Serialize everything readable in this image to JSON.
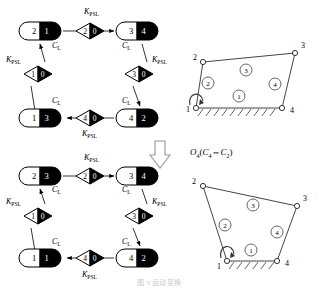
{
  "figure": {
    "caption": "图 3   运动变换",
    "transform_label": {
      "main": "O",
      "main_sub": "4",
      "paren_open": "(",
      "from": "C",
      "from_sub": "4",
      "arrow": "⇔",
      "to": "C",
      "to_sub": "2",
      "paren_close": ")"
    },
    "labels": {
      "kpsl": "K",
      "kpsl_sub": "PSL",
      "cl": "C",
      "cl_sub": "L"
    }
  },
  "graph_top": {
    "name": "kinematic-chain-graph-top",
    "nodes": [
      {
        "id": "n-tl",
        "left": "2",
        "right": "1",
        "x": 40,
        "y": 31
      },
      {
        "id": "n-tr",
        "left": "3",
        "right": "4",
        "x": 137,
        "y": 31
      },
      {
        "id": "n-bl",
        "left": "1",
        "right": "3",
        "x": 40,
        "y": 118
      },
      {
        "id": "n-br",
        "left": "4",
        "right": "2",
        "x": 137,
        "y": 118
      }
    ],
    "joints": [
      {
        "id": "j-top",
        "left": "2",
        "right": "0",
        "x": 90,
        "y": 31
      },
      {
        "id": "j-left",
        "left": "1",
        "right": "0",
        "x": 38,
        "y": 74
      },
      {
        "id": "j-right",
        "left": "3",
        "right": "0",
        "x": 139,
        "y": 74
      },
      {
        "id": "j-bottom",
        "left": "4",
        "right": "0",
        "x": 90,
        "y": 118
      }
    ],
    "kpsl_positions": [
      {
        "x": 84,
        "y": 14
      },
      {
        "x": 6,
        "y": 62
      },
      {
        "x": 152,
        "y": 62
      },
      {
        "x": 82,
        "y": 136
      }
    ],
    "cl_positions": [
      {
        "x": 52,
        "y": 48
      },
      {
        "x": 122,
        "y": 48
      },
      {
        "x": 52,
        "y": 103
      },
      {
        "x": 122,
        "y": 103
      }
    ]
  },
  "graph_bottom": {
    "name": "kinematic-chain-graph-bottom",
    "nodes": [
      {
        "id": "n2-tl",
        "left": "2",
        "right": "3",
        "x": 40,
        "y": 176
      },
      {
        "id": "n2-tr",
        "left": "3",
        "right": "4",
        "x": 137,
        "y": 176
      },
      {
        "id": "n2-bl",
        "left": "1",
        "right": "1",
        "x": 40,
        "y": 258
      },
      {
        "id": "n2-br",
        "left": "4",
        "right": "2",
        "x": 137,
        "y": 258
      }
    ],
    "joints": [
      {
        "id": "j2-top",
        "left": "2",
        "right": "0",
        "x": 90,
        "y": 176
      },
      {
        "id": "j2-left",
        "left": "1",
        "right": "0",
        "x": 38,
        "y": 216
      },
      {
        "id": "j2-right",
        "left": "3",
        "right": "0",
        "x": 139,
        "y": 216
      },
      {
        "id": "j2-bottom",
        "left": "4",
        "right": "0",
        "x": 90,
        "y": 258
      }
    ],
    "kpsl_positions": [
      {
        "x": 84,
        "y": 160
      },
      {
        "x": 6,
        "y": 204
      },
      {
        "x": 152,
        "y": 204
      },
      {
        "x": 82,
        "y": 275
      }
    ],
    "cl_positions": [
      {
        "x": 52,
        "y": 192
      },
      {
        "x": 122,
        "y": 192
      },
      {
        "x": 52,
        "y": 244
      },
      {
        "x": 122,
        "y": 244
      }
    ]
  },
  "linkage_top": {
    "name": "four-bar-linkage-top",
    "vertices": [
      {
        "label": "1",
        "x": 196,
        "y": 108,
        "lx": 186,
        "ly": 112
      },
      {
        "label": "2",
        "x": 203,
        "y": 62,
        "lx": 193,
        "ly": 60
      },
      {
        "label": "3",
        "x": 295,
        "y": 53,
        "lx": 301,
        "ly": 48
      },
      {
        "label": "4",
        "x": 282,
        "y": 108,
        "lx": 290,
        "ly": 113
      }
    ],
    "links": [
      {
        "label": "1",
        "x": 239,
        "y": 96
      },
      {
        "label": "2",
        "x": 208,
        "y": 83
      },
      {
        "label": "3",
        "x": 246,
        "y": 70
      },
      {
        "label": "4",
        "x": 275,
        "y": 84
      }
    ]
  },
  "linkage_bottom": {
    "name": "four-bar-linkage-bottom",
    "vertices": [
      {
        "label": "1",
        "x": 227,
        "y": 261,
        "lx": 217,
        "ly": 266
      },
      {
        "label": "2",
        "x": 203,
        "y": 186,
        "lx": 192,
        "ly": 184
      },
      {
        "label": "3",
        "x": 297,
        "y": 206,
        "lx": 303,
        "ly": 201
      },
      {
        "label": "4",
        "x": 277,
        "y": 261,
        "lx": 285,
        "ly": 266
      }
    ],
    "links": [
      {
        "label": "1",
        "x": 251,
        "y": 250
      },
      {
        "label": "2",
        "x": 225,
        "y": 225
      },
      {
        "label": "3",
        "x": 253,
        "y": 205
      },
      {
        "label": "4",
        "x": 277,
        "y": 232
      }
    ]
  }
}
